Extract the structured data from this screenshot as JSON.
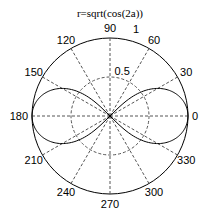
{
  "chart_data": {
    "type": "polar-line",
    "title": "r=sqrt(cos(2a))",
    "equation": "r = sqrt(cos(2*a))",
    "angle_ticks_deg": [
      0,
      30,
      60,
      90,
      120,
      150,
      180,
      210,
      240,
      270,
      300,
      330
    ],
    "angle_tick_labels": [
      "0",
      "30",
      "60",
      "90",
      "120",
      "150",
      "180",
      "210",
      "240",
      "270",
      "300",
      "330"
    ],
    "radial_ticks": [
      0.5,
      1
    ],
    "radial_tick_labels": [
      "0.5",
      "1"
    ],
    "rlim": [
      0,
      1
    ],
    "grid": true,
    "series": [
      {
        "name": "r=sqrt(cos(2a))",
        "theta_deg": [
          0,
          15,
          30,
          45,
          135,
          150,
          165,
          180,
          195,
          210,
          225,
          315,
          330,
          345,
          360
        ],
        "r": [
          1.0,
          0.931,
          0.707,
          0.0,
          0.0,
          0.707,
          0.931,
          1.0,
          0.931,
          0.707,
          0.0,
          0.0,
          0.707,
          0.931,
          1.0
        ],
        "color": "#000000"
      }
    ]
  },
  "layout": {
    "cx": 110,
    "cy": 116,
    "radius": 78,
    "line_color": "#000000",
    "grid_color": "#555555"
  }
}
